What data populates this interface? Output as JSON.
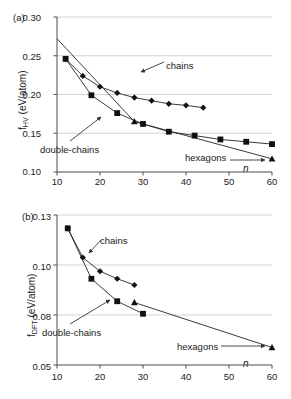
{
  "figure": {
    "panels": [
      {
        "tag": "(a)",
        "ylabel_main": "f",
        "ylabel_sub": "HV",
        "ylabel_units": " (eV/atom)",
        "xaxis_name": "n",
        "annotations": [
          {
            "label": "chains"
          },
          {
            "label": "double-chains"
          },
          {
            "label": "hexagons"
          }
        ]
      },
      {
        "tag": "(b)",
        "ylabel_main": "f",
        "ylabel_sub": "DFT",
        "ylabel_units": " (eV/atom)",
        "xaxis_name": "n",
        "annotations": [
          {
            "label": "chains"
          },
          {
            "label": "double-chains"
          },
          {
            "label": "hexagons"
          }
        ]
      }
    ]
  },
  "chart_data": [
    {
      "type": "line",
      "panel": "(a)",
      "title": "",
      "xlabel": "n",
      "ylabel": "f_HV (eV/atom)",
      "xlim": [
        10,
        60
      ],
      "ylim": [
        0.1,
        0.3
      ],
      "xticks": [
        10,
        20,
        30,
        40,
        50,
        60
      ],
      "xticklabels": [
        "10",
        "20",
        "30",
        "40",
        "50",
        "60"
      ],
      "yticks": [
        0.1,
        0.15,
        0.2,
        0.25,
        0.3
      ],
      "yticklabels": [
        "0.10",
        "0.15",
        "0.20",
        "0.25",
        "0.30"
      ],
      "grid": "horizontal",
      "legend": "annotations",
      "series": [
        {
          "name": "chains",
          "marker": "diamond",
          "x": [
            12,
            16,
            20,
            24,
            28,
            32,
            36,
            40,
            44
          ],
          "y": [
            0.246,
            0.224,
            0.21,
            0.202,
            0.196,
            0.192,
            0.188,
            0.186,
            0.183
          ]
        },
        {
          "name": "double-chains",
          "marker": "square",
          "x": [
            12,
            18,
            24,
            30,
            36,
            42,
            48,
            54,
            60
          ],
          "y": [
            0.246,
            0.199,
            0.176,
            0.162,
            0.152,
            0.147,
            0.142,
            0.139,
            0.136
          ]
        },
        {
          "name": "hexagons",
          "marker": "triangle",
          "x": [
            10,
            28,
            60
          ],
          "y": [
            0.272,
            0.165,
            0.117
          ]
        }
      ]
    },
    {
      "type": "line",
      "panel": "(b)",
      "title": "",
      "xlabel": "n",
      "ylabel": "f_DFT (eV/atom)",
      "xlim": [
        10,
        60
      ],
      "ylim": [
        0.05,
        0.13
      ],
      "xticks": [
        10,
        20,
        30,
        40,
        50,
        60
      ],
      "xticklabels": [
        "10",
        "20",
        "30",
        "40",
        "50",
        "60"
      ],
      "yticks": [
        0.05,
        0.08,
        0.1,
        0.13
      ],
      "yticklabels": [
        "0.05",
        "0.08",
        "0.10",
        "0.13"
      ],
      "grid": "horizontal",
      "legend": "annotations",
      "series": [
        {
          "name": "chains",
          "marker": "diamond",
          "x": [
            12.5,
            16,
            20,
            24,
            28
          ],
          "y": [
            0.122,
            0.1045,
            0.0975,
            0.0945,
            0.092
          ]
        },
        {
          "name": "double-chains",
          "marker": "square",
          "x": [
            12.5,
            18,
            24,
            30
          ],
          "y": [
            0.122,
            0.0945,
            0.0855,
            0.0805
          ]
        },
        {
          "name": "hexagons",
          "marker": "triangle",
          "x": [
            28,
            60
          ],
          "y": [
            0.085,
            0.0605
          ]
        }
      ]
    }
  ]
}
